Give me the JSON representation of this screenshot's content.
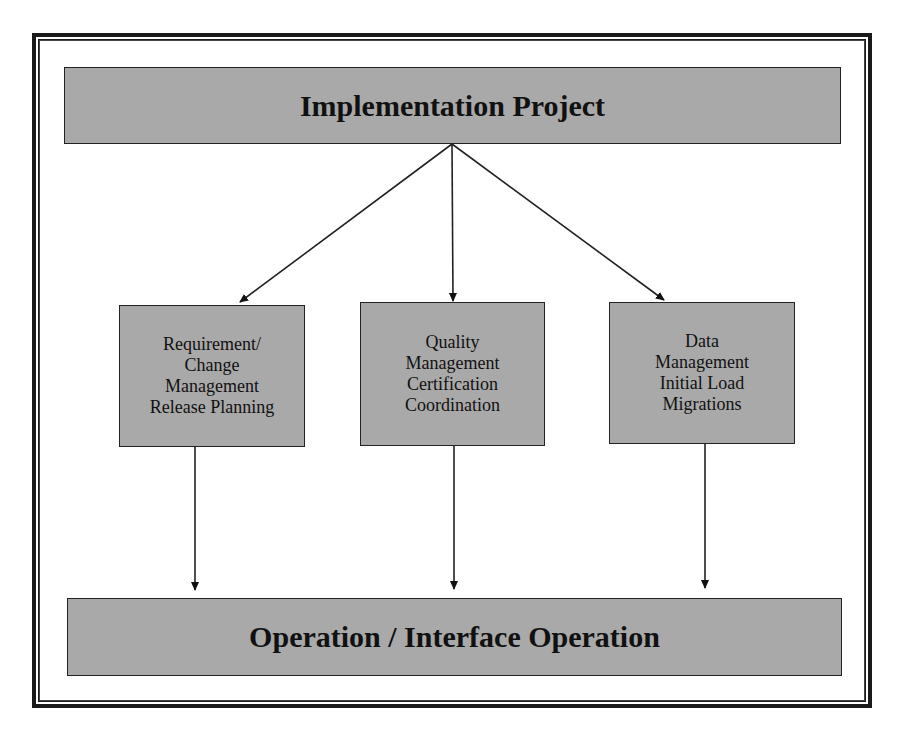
{
  "diagram": {
    "top": {
      "label": "Implementation Project"
    },
    "boxes": [
      {
        "lines": [
          "Requirement/",
          "Change",
          "Management",
          "Release Planning"
        ]
      },
      {
        "lines": [
          "Quality",
          "Management",
          "Certification",
          "Coordination"
        ]
      },
      {
        "lines": [
          "Data",
          "Management",
          "Initial Load",
          "Migrations"
        ]
      }
    ],
    "bottom": {
      "label": "Operation / Interface Operation"
    },
    "colors": {
      "box_fill": "#a9a9a9",
      "border": "#1a1a1a",
      "background": "#ffffff"
    }
  }
}
